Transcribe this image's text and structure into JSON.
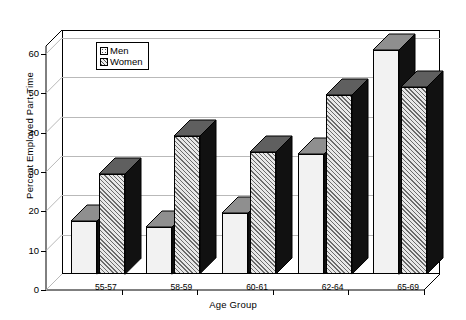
{
  "chart_data": {
    "type": "bar",
    "title": "",
    "xlabel": "Age Group",
    "ylabel": "Percent Employed Part-Time",
    "categories": [
      "55-57",
      "58-59",
      "60-61",
      "62-64",
      "65-69"
    ],
    "series": [
      {
        "name": "Men",
        "values": [
          13.5,
          12.0,
          15.5,
          30.5,
          57.0
        ]
      },
      {
        "name": "Women",
        "values": [
          25.5,
          35.0,
          31.0,
          45.5,
          47.5
        ]
      }
    ],
    "ylim": [
      0,
      62
    ],
    "yticks": [
      0,
      10,
      20,
      30,
      40,
      50,
      60
    ],
    "ytick_labels": [
      "0",
      "10",
      "20",
      "30",
      "40",
      "50",
      "60"
    ],
    "grid": true,
    "grid_axis": "y",
    "legend_position": "upper-left-inside",
    "style": "3d-clustered-column",
    "colors": {
      "men_fill": "#f2f2f2",
      "women_fill": "#d9d9d9",
      "bar_side": "#111111",
      "bar_outline": "#000000",
      "grid": "#b9b9b9",
      "axis": "#000000",
      "background": "#ffffff"
    }
  },
  "legend": {
    "entries": [
      {
        "label": "Men",
        "swatch": "dotted-light-swatch"
      },
      {
        "label": "Women",
        "swatch": "hatched-gray-swatch"
      }
    ]
  }
}
